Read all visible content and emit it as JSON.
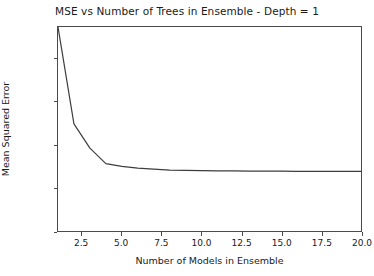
{
  "chart_data": {
    "type": "line",
    "title": "MSE vs Number of Trees in Ensemble - Depth = 1",
    "xlabel": "Number of Models in Ensemble",
    "ylabel": "Mean Squared Error",
    "xlim": [
      1.0,
      20.0
    ],
    "ylim": [
      0.0,
      0.0947
    ],
    "grid": false,
    "legend": null,
    "line_color": "#3d3d3d",
    "line_width": 1.2,
    "xticks": [
      2.5,
      5.0,
      7.5,
      10.0,
      12.5,
      15.0,
      17.5,
      20.0
    ],
    "xtick_labels": [
      "2.5",
      "5.0",
      "7.5",
      "10.0",
      "12.5",
      "15.0",
      "17.5",
      "20.0"
    ],
    "yticks": [
      0.0,
      0.02,
      0.04,
      0.06,
      0.08
    ],
    "ytick_labels": [
      "0.00",
      "0.02",
      "0.04",
      "0.06",
      "0.08"
    ],
    "x": [
      1,
      2,
      3,
      4,
      5,
      6,
      7,
      8,
      9,
      10,
      11,
      12,
      13,
      14,
      15,
      16,
      17,
      18,
      19,
      20
    ],
    "values": [
      0.0947,
      0.0497,
      0.0385,
      0.0313,
      0.03,
      0.0292,
      0.0287,
      0.0283,
      0.0281,
      0.028,
      0.0279,
      0.0279,
      0.0278,
      0.0278,
      0.0278,
      0.0277,
      0.0277,
      0.0277,
      0.0277,
      0.0277
    ],
    "series": [
      {
        "name": "MSE",
        "values": [
          0.0947,
          0.0497,
          0.0385,
          0.0313,
          0.03,
          0.0292,
          0.0287,
          0.0283,
          0.0281,
          0.028,
          0.0279,
          0.0279,
          0.0278,
          0.0278,
          0.0278,
          0.0277,
          0.0277,
          0.0277,
          0.0277,
          0.0277
        ]
      }
    ]
  }
}
